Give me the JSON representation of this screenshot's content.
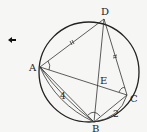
{
  "diagram": {
    "type": "circle-geometry",
    "points": {
      "A": {
        "label": "A"
      },
      "B": {
        "label": "B"
      },
      "C": {
        "label": "C"
      },
      "D": {
        "label": "D"
      },
      "E": {
        "label": "E"
      }
    },
    "lengths": {
      "AB": "4",
      "BC": "2"
    },
    "marks": {
      "equal_segments": [
        "AD",
        "CD"
      ],
      "angle_marks": [
        "angle-A",
        "angle-C",
        "angle-B"
      ]
    },
    "arrow": {
      "symbol": "←"
    }
  }
}
